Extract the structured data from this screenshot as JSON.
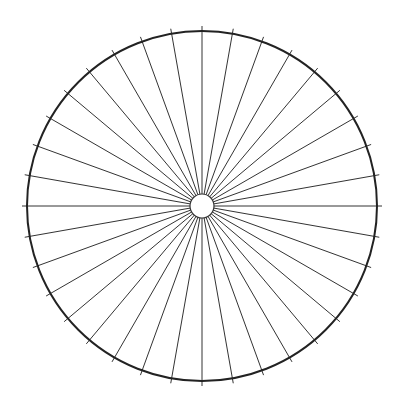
{
  "diagram": {
    "type": "radial-wheel",
    "center": [
      202,
      206
    ],
    "outer_radius": 175,
    "inner_radius": 12,
    "spoke_count": 36,
    "spoke_angle_step_deg": 10,
    "tick_length_outside": 5,
    "colors": {
      "background": "#ffffff",
      "outer_circle": "#222222",
      "spokes": "#333333",
      "inner_circle": "#333333"
    },
    "stroke_widths": {
      "outer_circle": 2,
      "spokes": 1,
      "inner_circle": 1.2
    }
  }
}
